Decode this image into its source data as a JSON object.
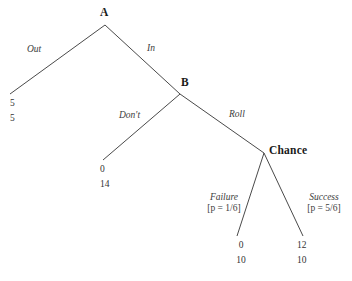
{
  "figure": {
    "type": "game-tree",
    "background_color": "#ffffff",
    "line_color": "#4a4a4a"
  },
  "nodes": [
    {
      "id": "A",
      "label": "A",
      "kind": "decision",
      "x": 105,
      "y": 25
    },
    {
      "id": "B",
      "label": "B",
      "kind": "decision",
      "x": 180,
      "y": 94
    },
    {
      "id": "C",
      "label": "Chance",
      "kind": "chance",
      "x": 264,
      "y": 153
    }
  ],
  "edges": [
    {
      "from": "A",
      "to": "out_terminal",
      "label": "Out",
      "x1": 105,
      "y1": 25,
      "x2": 10,
      "y2": 94
    },
    {
      "from": "A",
      "to": "B",
      "label": "In",
      "x1": 105,
      "y1": 25,
      "x2": 180,
      "y2": 94
    },
    {
      "from": "B",
      "to": "dont_terminal",
      "label": "Don't",
      "x1": 180,
      "y1": 94,
      "x2": 103,
      "y2": 160
    },
    {
      "from": "B",
      "to": "C",
      "label": "Roll",
      "x1": 180,
      "y1": 94,
      "x2": 264,
      "y2": 153
    },
    {
      "from": "C",
      "to": "fail_terminal",
      "label": "Failure",
      "x1": 264,
      "y1": 153,
      "x2": 237,
      "y2": 236
    },
    {
      "from": "C",
      "to": "succ_terminal",
      "label": "Success",
      "x1": 264,
      "y1": 153,
      "x2": 303,
      "y2": 236
    }
  ],
  "edge_labels": {
    "out": {
      "text": "Out",
      "x": 30,
      "y": 44
    },
    "in": {
      "text": "In",
      "x": 146,
      "y": 43
    },
    "dont": {
      "text": "Don't",
      "x": 120,
      "y": 110
    },
    "roll": {
      "text": "Roll",
      "x": 228,
      "y": 109
    }
  },
  "chance_moves": [
    {
      "id": "failure",
      "name": "Failure",
      "probability_text": "[p = 1/6]",
      "probability_symbol": "p",
      "probability_value": "1/6",
      "x": 202,
      "y": 193
    },
    {
      "id": "success",
      "name": "Success",
      "probability_text": "[p = 5/6]",
      "probability_symbol": "p",
      "probability_value": "5/6",
      "x": 302,
      "y": 193
    }
  ],
  "terminals": [
    {
      "id": "out_terminal",
      "player1": "5",
      "player2": "5",
      "x": 10,
      "y": 96
    },
    {
      "id": "dont_terminal",
      "player1": "0",
      "player2": "14",
      "x": 100,
      "y": 162
    },
    {
      "id": "fail_terminal",
      "player1": "0",
      "player2": "10",
      "x": 237,
      "y": 238
    },
    {
      "id": "succ_terminal",
      "player1": "12",
      "player2": "10",
      "x": 300,
      "y": 238
    }
  ]
}
